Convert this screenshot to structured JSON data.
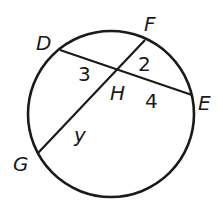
{
  "diagram": {
    "type": "circle-intersecting-chords",
    "stroke_color": "#1a1a1a",
    "circle": {
      "cx": 111,
      "cy": 114,
      "r": 83
    },
    "points": {
      "D": {
        "label": "D",
        "x": 60,
        "y": 50
      },
      "E": {
        "label": "E",
        "x": 192,
        "y": 95
      },
      "F": {
        "label": "F",
        "x": 145,
        "y": 40
      },
      "G": {
        "label": "G",
        "x": 38,
        "y": 153
      },
      "H": {
        "label": "H",
        "x": 118,
        "y": 70
      }
    },
    "chords": [
      {
        "name": "DE",
        "from": "D",
        "to": "E"
      },
      {
        "name": "FG",
        "from": "F",
        "to": "G"
      }
    ],
    "segment_labels": {
      "DH": "3",
      "FH": "2",
      "HE": "4",
      "HG": "y"
    }
  }
}
